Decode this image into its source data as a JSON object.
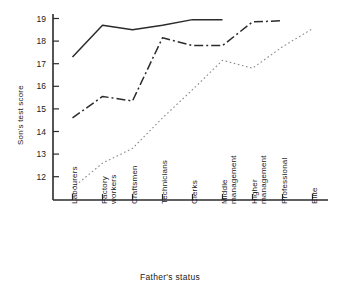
{
  "chart_data": {
    "type": "line",
    "title": "",
    "xlabel": "Father's status",
    "ylabel": "Son's test score",
    "categories": [
      "Labourers",
      "Factory workers",
      "Craftsmen",
      "Technicians",
      "Clerks",
      "Middle management",
      "Higher management",
      "Professional",
      "Elite"
    ],
    "categories_lines": [
      [
        "Labourers"
      ],
      [
        "Factory",
        "workers"
      ],
      [
        "Craftsmen"
      ],
      [
        "Technicians"
      ],
      [
        "Clerks"
      ],
      [
        "Middle",
        "management"
      ],
      [
        "Higher",
        "management"
      ],
      [
        "Professional"
      ],
      [
        "Elite"
      ]
    ],
    "ylim": [
      11.2,
      19.35
    ],
    "yticks": [
      12,
      13,
      14,
      15,
      16,
      17,
      18,
      19
    ],
    "ytick_labels": [
      "12",
      "13",
      "14",
      "15",
      "16",
      "17",
      "18",
      "19"
    ],
    "grid": false,
    "legend": "none",
    "series": [
      {
        "name": "upper-series",
        "style": "solid",
        "color": "#2b2b2b",
        "x": [
          0,
          1,
          2,
          3,
          4,
          5
        ],
        "values": [
          17.3,
          18.7,
          18.5,
          18.7,
          18.95,
          18.95
        ]
      },
      {
        "name": "middle-series",
        "style": "dash-dot",
        "color": "#2b2b2b",
        "x": [
          0,
          1,
          2,
          3,
          4,
          5,
          6,
          7
        ],
        "values": [
          14.6,
          15.55,
          15.35,
          18.15,
          17.8,
          17.8,
          18.85,
          18.9
        ]
      },
      {
        "name": "lower-series",
        "style": "dotted",
        "color": "#8a8a8a",
        "x": [
          0,
          1,
          2,
          3,
          4,
          5,
          6,
          7,
          8
        ],
        "values": [
          11.5,
          12.6,
          13.25,
          14.6,
          15.85,
          17.15,
          16.8,
          17.75,
          18.55
        ]
      }
    ]
  },
  "axes": {
    "y_axis_label": "Son's test score",
    "x_axis_label": "Father's status"
  }
}
